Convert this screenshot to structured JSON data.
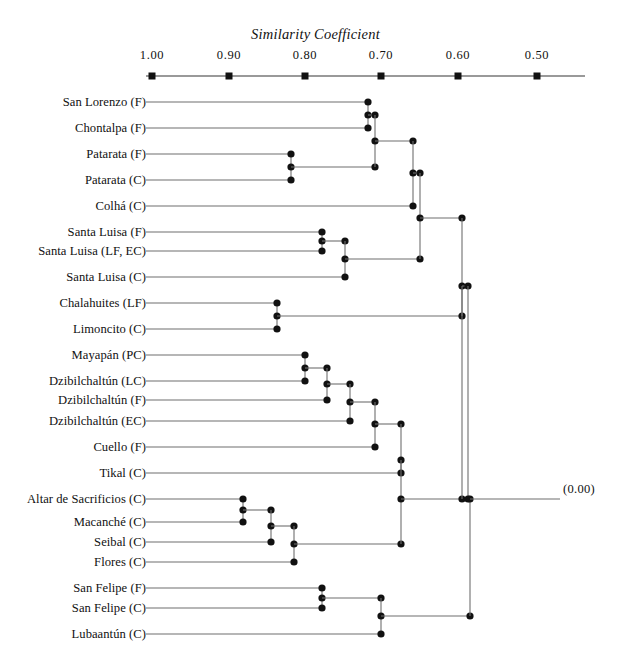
{
  "chart_data": {
    "type": "dendrogram",
    "title": "Similarity Coefficient",
    "xlabel": "Similarity Coefficient",
    "ylabel": "",
    "axis": {
      "orientation": "horizontal-top",
      "direction": "decreasing-left-to-right",
      "tick_labels": [
        "1.00",
        "0.90",
        "0.80",
        "0.70",
        "0.60",
        "0.50"
      ],
      "tick_values": [
        1.0,
        0.9,
        0.8,
        0.7,
        0.6,
        0.5
      ],
      "tick_px": [
        152,
        229,
        305,
        381,
        458,
        537
      ],
      "axis_line_y": 76,
      "xlim": [
        1.0,
        0.45
      ],
      "grid": false,
      "extra_label": "(0.00)",
      "extra_label_value": 0.0
    },
    "leaves": [
      {
        "label": "San Lorenzo (F)",
        "y": 102
      },
      {
        "label": "Chontalpa (F)",
        "y": 128
      },
      {
        "label": "Patarata (F)",
        "y": 154
      },
      {
        "label": "Patarata (C)",
        "y": 180
      },
      {
        "label": "Colhá (C)",
        "y": 206
      },
      {
        "label": "Santa Luisa (F)",
        "y": 232
      },
      {
        "label": "Santa Luisa (LF, EC)",
        "y": 251
      },
      {
        "label": "Santa Luisa (C)",
        "y": 277
      },
      {
        "label": "Chalahuites (LF)",
        "y": 303
      },
      {
        "label": "Limoncito (C)",
        "y": 329
      },
      {
        "label": "Mayapán (PC)",
        "y": 355
      },
      {
        "label": "Dzibilchaltún (LC)",
        "y": 381
      },
      {
        "label": "Dzibilchaltún (F)",
        "y": 400
      },
      {
        "label": "Dzibilchaltún (EC)",
        "y": 421
      },
      {
        "label": "Cuello (F)",
        "y": 447
      },
      {
        "label": "Tikal (C)",
        "y": 473
      },
      {
        "label": "Altar de Sacrificios (C)",
        "y": 499
      },
      {
        "label": "Macanché (C)",
        "y": 522
      },
      {
        "label": "Seibal (C)",
        "y": 542
      },
      {
        "label": "Flores (C)",
        "y": 562
      },
      {
        "label": "San Felipe (F)",
        "y": 588
      },
      {
        "label": "San Felipe (C)",
        "y": 608
      },
      {
        "label": "Lubaantún (C)",
        "y": 634
      }
    ],
    "leaf_line_start_px": 146,
    "merges": [
      {
        "id": "m1",
        "x": 368,
        "children_y": [
          102,
          128
        ],
        "note": "San Lorenzo (F) + Chontalpa (F)"
      },
      {
        "id": "m2",
        "x": 291,
        "children_y": [
          154,
          180
        ],
        "note": "Patarata (F) + Patarata (C)"
      },
      {
        "id": "m3",
        "x": 375,
        "children_y": [
          115,
          167
        ],
        "note": "m1 + m2"
      },
      {
        "id": "m4",
        "x": 413,
        "children_y": [
          141,
          206
        ],
        "note": "m3 + Colhá (C)"
      },
      {
        "id": "m5",
        "x": 322,
        "children_y": [
          232,
          251
        ],
        "note": "Santa Luisa (F) + Santa Luisa (LF, EC)"
      },
      {
        "id": "m6",
        "x": 345,
        "children_y": [
          241,
          277
        ],
        "note": "m5 + Santa Luisa (C)"
      },
      {
        "id": "m7",
        "x": 420,
        "children_y": [
          173,
          259
        ],
        "note": "m4 + m6"
      },
      {
        "id": "m8",
        "x": 277,
        "children_y": [
          303,
          329
        ],
        "note": "Chalahuites (LF) + Limoncito (C)"
      },
      {
        "id": "m9",
        "x": 462,
        "children_y": [
          218,
          316
        ],
        "note": "m7 + m8"
      },
      {
        "id": "m10",
        "x": 305,
        "children_y": [
          355,
          381
        ],
        "note": "Mayapán (PC) + Dzibilchaltún (LC)"
      },
      {
        "id": "m11",
        "x": 327,
        "children_y": [
          368,
          400
        ],
        "note": "m10 + Dzibilchaltún (F)"
      },
      {
        "id": "m12",
        "x": 350,
        "children_y": [
          384,
          421
        ],
        "note": "m11 + Dzibilchaltún (EC)"
      },
      {
        "id": "m13",
        "x": 375,
        "children_y": [
          402,
          447
        ],
        "note": "m12 + Cuello (F)"
      },
      {
        "id": "m14",
        "x": 401,
        "children_y": [
          424,
          473
        ],
        "note": "m13 + Tikal (C)"
      },
      {
        "id": "m15",
        "x": 468,
        "children_y": [
          286,
          448
        ],
        "note": "m9 + m14"
      },
      {
        "id": "m16",
        "x": 243,
        "children_y": [
          499,
          522
        ],
        "note": "Altar de Sacrificios (C) + Macanché (C)"
      },
      {
        "id": "m17",
        "x": 271,
        "children_y": [
          510,
          542
        ],
        "note": "m16 + Seibal (C)"
      },
      {
        "id": "m18",
        "x": 294,
        "children_y": [
          526,
          562
        ],
        "note": "m17 + Flores (C)"
      },
      {
        "id": "m19",
        "x": 401,
        "children_y": [
          460,
          544
        ],
        "note": "m14-branch + m18"
      },
      {
        "id": "m20",
        "x": 322,
        "children_y": [
          588,
          608
        ],
        "note": "San Felipe (F) + San Felipe (C)"
      },
      {
        "id": "m21",
        "x": 381,
        "children_y": [
          598,
          634
        ],
        "note": "m20 + Lubaantún (C)"
      },
      {
        "id": "m22",
        "x": 470,
        "children_y": [
          487,
          616
        ],
        "note": "root: m15-branch + m21"
      }
    ]
  },
  "labels": {
    "title": "Similarity Coefficient",
    "zero_marker": "(0.00)"
  },
  "axis_ticks": [
    {
      "text": "1.00",
      "x": 152
    },
    {
      "text": "0.90",
      "x": 229
    },
    {
      "text": "0.80",
      "x": 305
    },
    {
      "text": "0.70",
      "x": 381
    },
    {
      "text": "0.60",
      "x": 458
    },
    {
      "text": "0.50",
      "x": 537
    }
  ],
  "leaf_labels": [
    "San Lorenzo (F)",
    "Chontalpa (F)",
    "Patarata (F)",
    "Patarata (C)",
    "Colhá (C)",
    "Santa Luisa (F)",
    "Santa Luisa (LF, EC)",
    "Santa Luisa (C)",
    "Chalahuites (LF)",
    "Limoncito (C)",
    "Mayapán (PC)",
    "Dzibilchaltún (LC)",
    "Dzibilchaltún (F)",
    "Dzibilchaltún (EC)",
    "Cuello (F)",
    "Tikal (C)",
    "Altar de Sacrificios (C)",
    "Macanché (C)",
    "Seibal (C)",
    "Flores (C)",
    "San Felipe (F)",
    "San Felipe (C)",
    "Lubaantún (C)"
  ],
  "colors": {
    "ink": "#111111",
    "line": "#6f6f6f",
    "node": "#111111",
    "background": "#ffffff"
  }
}
